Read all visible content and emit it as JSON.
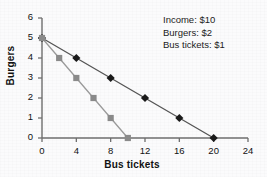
{
  "chart_data": {
    "type": "line",
    "title": "",
    "subtitle": "",
    "xlabel": "Bus tickets",
    "ylabel": "Burgers",
    "xlim": [
      0,
      24
    ],
    "ylim": [
      0,
      6
    ],
    "xticks": [
      0,
      4,
      8,
      12,
      16,
      20,
      24
    ],
    "yticks": [
      0,
      1,
      2,
      3,
      4,
      5,
      6
    ],
    "grid": false,
    "legend": "none",
    "annotations": [
      "Income: $10",
      "Burgers: $2",
      "Bus tickets: $1"
    ],
    "series": [
      {
        "name": "budget-line-diamond",
        "marker": "diamond",
        "color": "#1a1a1a",
        "line_color": "#555555",
        "x": [
          0,
          4,
          8,
          12,
          16,
          20
        ],
        "y": [
          5,
          4,
          3,
          2,
          1,
          0
        ]
      },
      {
        "name": "budget-line-square",
        "marker": "square",
        "color": "#8a8a8a",
        "line_color": "#9a9a9a",
        "x": [
          0,
          2,
          4,
          6,
          8,
          10
        ],
        "y": [
          5,
          4,
          3,
          2,
          1,
          0
        ]
      }
    ]
  },
  "axes": {
    "y_title": "Burgers",
    "x_title": "Bus tickets",
    "y_tick_labels": [
      "6",
      "5",
      "4",
      "3",
      "2",
      "1",
      "0"
    ],
    "x_tick_labels": [
      "0",
      "4",
      "8",
      "12",
      "16",
      "20",
      "24"
    ]
  },
  "annotation": {
    "line1": "Income: $10",
    "line2": "Burgers: $2",
    "line3": "Bus tickets: $1"
  }
}
